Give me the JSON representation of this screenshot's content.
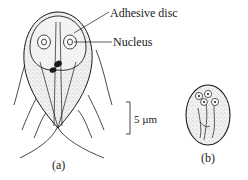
{
  "figure": {
    "labels": {
      "adhesive_disc": "Adhesive disc",
      "nucleus": "Nucleus",
      "scale_bar": "5 µm",
      "panel_a": "(a)",
      "panel_b": "(b)"
    },
    "panels": [
      {
        "id": "a",
        "subject": "trophozoite",
        "caption": "(a)"
      },
      {
        "id": "b",
        "subject": "cyst",
        "caption": "(b)"
      }
    ],
    "colors": {
      "ink": "#1a1a1a",
      "stipple": "#b8b8b8",
      "background": "#ffffff"
    }
  }
}
